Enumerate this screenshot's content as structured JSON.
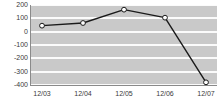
{
  "chart_data": {
    "type": "line",
    "title": "",
    "subtitle": "",
    "xlabel": "",
    "ylabel": "",
    "categories": [
      "12/03",
      "12/04",
      "12/05",
      "12/06",
      "12/07"
    ],
    "series": [
      {
        "name": "series-1",
        "values": [
          45,
          65,
          165,
          105,
          -380
        ],
        "line_color": "#1a1a1a",
        "marker": "circle",
        "marker_fill": "#ffffff",
        "marker_edge": "#1a1a1a"
      }
    ],
    "ylim": [
      -400,
      200
    ],
    "ytick_values": [
      200,
      100,
      0,
      -100,
      -200,
      -300,
      -400
    ],
    "ytick_labels": [
      "200",
      "100",
      "0",
      "-100",
      "-200",
      "-300",
      "-400"
    ],
    "xtick_labels": [
      "12/03",
      "12/04",
      "12/05",
      "12/06",
      "12/07"
    ],
    "grid": true,
    "grid_color": "#fbfbfb",
    "plot_background": "#c9c9c9",
    "figure_background": "#ffffff",
    "axis_color": "#8a8a8a",
    "tick_label_color": "#3a3a3a",
    "legend": null,
    "legend_position": "none",
    "annotations": []
  }
}
